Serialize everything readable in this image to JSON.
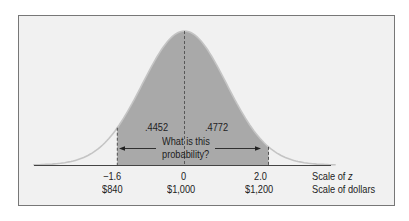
{
  "chart_data": {
    "type": "area",
    "title": "",
    "distribution": {
      "mean_z": 0,
      "sd_z": 1,
      "mean_dollars": 1000,
      "sd_dollars": 100
    },
    "shaded_region": {
      "z_from": -1.6,
      "z_to": 2.0
    },
    "areas": [
      {
        "label": ".4452",
        "z_from": -1.6,
        "z_to": 0,
        "value": 0.4452
      },
      {
        "label": ".4772",
        "z_from": 0,
        "z_to": 2.0,
        "value": 0.4772
      }
    ],
    "annotation": "What is this probability?",
    "x_ticks_z": [
      "−1.6",
      "0",
      "2.0"
    ],
    "x_ticks_dollars": [
      "$840",
      "$1,000",
      "$1,200"
    ],
    "axis_labels": [
      "Scale of z",
      "Scale of dollars"
    ],
    "grid": false,
    "legend": null
  },
  "labels": {
    "area_left": ".4452",
    "area_right": ".4772",
    "question_line1": "What is this",
    "question_line2": "probability?",
    "z_tick_1": "−1.6",
    "z_tick_2": "0",
    "z_tick_3": "2.0",
    "d_tick_1": "$840",
    "d_tick_2": "$1,000",
    "d_tick_3": "$1,200",
    "z_scale_prefix": "Scale of ",
    "z_scale_var": "z",
    "dollar_scale": "Scale of dollars"
  },
  "colors": {
    "shade": "#a9a9a9",
    "curve": "#bdbdbd",
    "background": "#f1f1f1",
    "axis": "#444444"
  }
}
